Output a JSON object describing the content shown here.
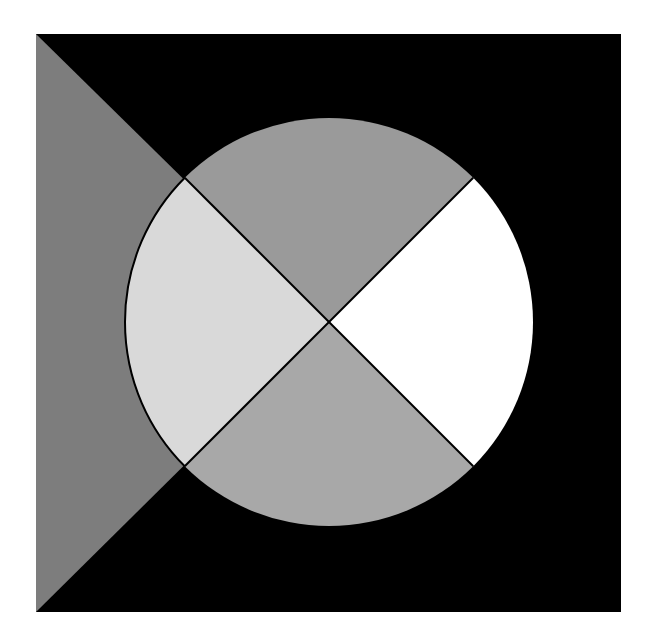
{
  "figure": {
    "square": {
      "x": 36,
      "y": 34,
      "width": 585,
      "height": 578,
      "fill": "#000000"
    },
    "center": {
      "x": 329,
      "y": 322
    },
    "left_triangle": {
      "fill": "#7d7d7d"
    },
    "circle": {
      "radius": 204,
      "quadrants": {
        "top": "#9a9a9a",
        "right": "#ffffff",
        "bottom": "#a8a8a8",
        "left": "#d9d9d9"
      },
      "divider_color": "#000000"
    },
    "background": "#ffffff"
  }
}
